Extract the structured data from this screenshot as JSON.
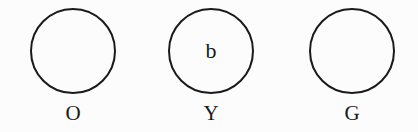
{
  "diagram": {
    "nodes": [
      {
        "id": "O",
        "label": "O",
        "content": "",
        "center_x": 73
      },
      {
        "id": "Y",
        "label": "Y",
        "content": "b",
        "center_x": 211
      },
      {
        "id": "G",
        "label": "G",
        "content": "",
        "center_x": 352
      }
    ],
    "stroke_color": "#1a1a1a",
    "background_color": "#fcfcfc"
  }
}
